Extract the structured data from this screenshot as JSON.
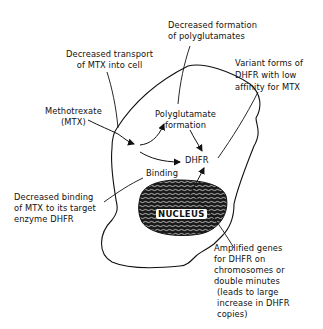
{
  "diagram": {
    "nodes": {
      "methotrexate": {
        "lines": [
          "Methotrexate",
          "(MTX)"
        ]
      },
      "polyglutamate": {
        "lines": [
          "Polyglutamate",
          "formation"
        ]
      },
      "dhfr": {
        "label": "DHFR"
      },
      "binding": {
        "label": "Binding"
      },
      "nucleus": {
        "label": "NUCLEUS"
      }
    },
    "annotations": {
      "decreased_transport": {
        "lines": [
          "Decreased transport",
          "of MTX into cell"
        ]
      },
      "decreased_polyglutamates": {
        "lines": [
          "Decreased formation",
          "of polyglutamates"
        ]
      },
      "variant_dhfr": {
        "lines": [
          "Variant forms of",
          "DHFR with low",
          "affinity for MTX"
        ]
      },
      "decreased_binding": {
        "lines": [
          "Decreased binding",
          "of MTX to its target",
          "enzyme DHFR"
        ]
      },
      "amplified_genes": {
        "lines": [
          "Amplified genes",
          "for DHFR on",
          "chromosomes or",
          "double minutes",
          "(leads to large",
          "increase in DHFR",
          "copies)"
        ]
      }
    },
    "edges": [
      {
        "from": "Methotrexate (MTX)",
        "to": "Polyglutamate formation"
      },
      {
        "from": "Methotrexate (MTX)",
        "to": "DHFR"
      },
      {
        "from": "Polyglutamate formation",
        "to": "DHFR"
      },
      {
        "from": "NUCLEUS",
        "to": "DHFR"
      }
    ],
    "colors": {
      "ink": "#111111",
      "background": "#ffffff"
    }
  }
}
